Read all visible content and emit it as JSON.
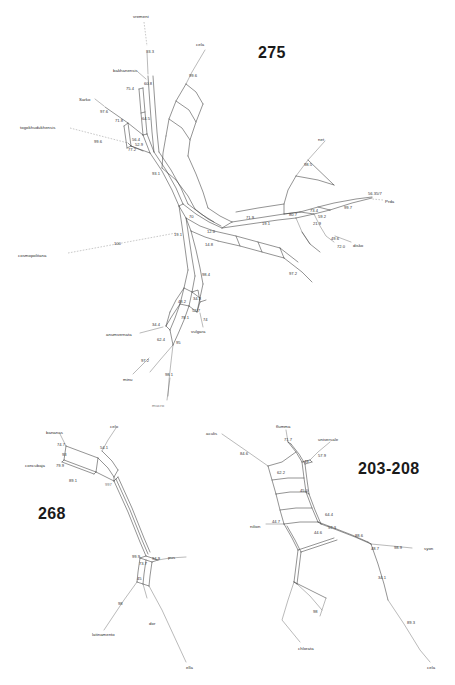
{
  "figure": {
    "background_color": "#ffffff",
    "line_color": "#3a3a3a",
    "panels": [
      {
        "id": "panel-275",
        "label": "275",
        "x": 258,
        "y": 44
      },
      {
        "id": "panel-268",
        "label": "268",
        "x": 38,
        "y": 505
      },
      {
        "id": "panel-203-208",
        "label": "203-208",
        "x": 358,
        "y": 460
      }
    ]
  },
  "panel_275": {
    "title": "275",
    "taxa": [
      {
        "name": "vremeni",
        "x": 133,
        "y": 14
      },
      {
        "name": "cela",
        "x": 196,
        "y": 42
      },
      {
        "name": "bakhanensis",
        "x": 113,
        "y": 68
      },
      {
        "name": "Sarko",
        "x": 79,
        "y": 97
      },
      {
        "name": "togokhudukhensis",
        "x": 20,
        "y": 125
      },
      {
        "name": "cosmopolitana",
        "x": 18,
        "y": 253
      },
      {
        "name": "net",
        "x": 318,
        "y": 137
      },
      {
        "name": "Prda",
        "x": 385,
        "y": 199
      },
      {
        "name": "disko",
        "x": 353,
        "y": 243
      },
      {
        "name": "vulgara",
        "x": 191,
        "y": 329
      },
      {
        "name": "anumvernata",
        "x": 106,
        "y": 332
      },
      {
        "name": "minu",
        "x": 123,
        "y": 377
      },
      {
        "name": "mucro",
        "x": 152,
        "y": 403
      }
    ],
    "supports": [
      {
        "value": "93.3",
        "x": 146,
        "y": 49
      },
      {
        "value": "99.6",
        "x": 189,
        "y": 73
      },
      {
        "value": "60.8",
        "x": 144,
        "y": 81
      },
      {
        "value": "75.4",
        "x": 126,
        "y": 86
      },
      {
        "value": "97.6",
        "x": 100,
        "y": 109
      },
      {
        "value": "71.8",
        "x": 115,
        "y": 118
      },
      {
        "value": "64.5",
        "x": 142,
        "y": 116
      },
      {
        "value": "56.4",
        "x": 132,
        "y": 137
      },
      {
        "value": "99.6",
        "x": 94,
        "y": 139
      },
      {
        "value": "77.2",
        "x": 128,
        "y": 147
      },
      {
        "value": "52.9",
        "x": 135,
        "y": 142
      },
      {
        "value": "93.1",
        "x": 152,
        "y": 171
      },
      {
        "value": "98.5",
        "x": 304,
        "y": 162
      },
      {
        "value": "100",
        "x": 114,
        "y": 241
      },
      {
        "value": "56.35/7",
        "x": 372,
        "y": 193
      },
      {
        "value": "99.7",
        "x": 344,
        "y": 205
      },
      {
        "value": "70",
        "x": 189,
        "y": 214
      },
      {
        "value": "80.7",
        "x": 289,
        "y": 212
      },
      {
        "value": "73.4",
        "x": 310,
        "y": 210
      },
      {
        "value": "59.2",
        "x": 318,
        "y": 214
      },
      {
        "value": "21.9",
        "x": 313,
        "y": 221
      },
      {
        "value": "12.0",
        "x": 207,
        "y": 223
      },
      {
        "value": "71.9",
        "x": 246,
        "y": 215
      },
      {
        "value": "19.1",
        "x": 262,
        "y": 221
      },
      {
        "value": "19.1",
        "x": 174,
        "y": 232
      },
      {
        "value": "14.8",
        "x": 205,
        "y": 242
      },
      {
        "value": "49.6",
        "x": 331,
        "y": 236
      },
      {
        "value": "72.0",
        "x": 340,
        "y": 244
      },
      {
        "value": "97.2",
        "x": 289,
        "y": 271
      },
      {
        "value": "98.4",
        "x": 202,
        "y": 272
      },
      {
        "value": "48.2",
        "x": 180,
        "y": 299
      },
      {
        "value": "34.3",
        "x": 193,
        "y": 297
      },
      {
        "value": "52.7",
        "x": 192,
        "y": 308
      },
      {
        "value": "34.4",
        "x": 152,
        "y": 322
      },
      {
        "value": "78.1",
        "x": 181,
        "y": 315
      },
      {
        "value": "74",
        "x": 203,
        "y": 317
      },
      {
        "value": "62.4",
        "x": 157,
        "y": 337
      },
      {
        "value": "95",
        "x": 176,
        "y": 340
      },
      {
        "value": "97.2",
        "x": 141,
        "y": 358
      },
      {
        "value": "98.1",
        "x": 165,
        "y": 372
      }
    ]
  },
  "panel_268": {
    "title": "268",
    "taxa": [
      {
        "name": "bananas",
        "x": 46,
        "y": 430
      },
      {
        "name": "celo",
        "x": 110,
        "y": 424
      },
      {
        "name": "concubaja",
        "x": 25,
        "y": 463
      },
      {
        "name": "latinamento",
        "x": 92,
        "y": 632
      },
      {
        "name": "pus",
        "x": 168,
        "y": 557
      },
      {
        "name": "dor",
        "x": 149,
        "y": 621
      },
      {
        "name": "ella",
        "x": 186,
        "y": 667
      }
    ],
    "supports": [
      {
        "value": "74.7",
        "x": 57,
        "y": 442
      },
      {
        "value": "54.1",
        "x": 100,
        "y": 445
      },
      {
        "value": "93",
        "x": 62,
        "y": 452
      },
      {
        "value": "79.9",
        "x": 56,
        "y": 463
      },
      {
        "value": "89.1",
        "x": 69,
        "y": 478
      },
      {
        "value": "997",
        "x": 105,
        "y": 482
      },
      {
        "value": "99.9",
        "x": 138,
        "y": 556
      },
      {
        "value": "73.7",
        "x": 139,
        "y": 561
      },
      {
        "value": "94.9",
        "x": 152,
        "y": 557
      },
      {
        "value": "45",
        "x": 137,
        "y": 576
      },
      {
        "value": "98",
        "x": 118,
        "y": 601
      }
    ]
  },
  "panel_203_208": {
    "title": "203-208",
    "taxa": [
      {
        "name": "aculis",
        "x": 206,
        "y": 431
      },
      {
        "name": "flumma",
        "x": 276,
        "y": 424
      },
      {
        "name": "universale",
        "x": 320,
        "y": 437
      },
      {
        "name": "nilion",
        "x": 250,
        "y": 524
      },
      {
        "name": "syon",
        "x": 424,
        "y": 548
      },
      {
        "name": "chlorata",
        "x": 300,
        "y": 648
      },
      {
        "name": "cela",
        "x": 427,
        "y": 667
      }
    ],
    "supports": [
      {
        "value": "84.6",
        "x": 240,
        "y": 451
      },
      {
        "value": "71.7",
        "x": 284,
        "y": 437
      },
      {
        "value": "57.9",
        "x": 318,
        "y": 453
      },
      {
        "value": "62.2",
        "x": 277,
        "y": 470
      },
      {
        "value": "49",
        "x": 304,
        "y": 459
      },
      {
        "value": "45.0",
        "x": 303,
        "y": 488
      },
      {
        "value": "64.4",
        "x": 327,
        "y": 512
      },
      {
        "value": "44.7",
        "x": 276,
        "y": 519
      },
      {
        "value": "44.6",
        "x": 318,
        "y": 530
      },
      {
        "value": "57.3",
        "x": 330,
        "y": 526
      },
      {
        "value": "88.6",
        "x": 357,
        "y": 535
      },
      {
        "value": "48.7",
        "x": 374,
        "y": 546
      },
      {
        "value": "98.9",
        "x": 396,
        "y": 546
      },
      {
        "value": "34.1",
        "x": 380,
        "y": 575
      },
      {
        "value": "98",
        "x": 314,
        "y": 609
      },
      {
        "value": "89.3",
        "x": 409,
        "y": 620
      }
    ]
  },
  "colors": {
    "edge": "#3a3a3a",
    "leader": "#777777",
    "title": "#1a1a1a",
    "label": "#2b2b2b"
  }
}
